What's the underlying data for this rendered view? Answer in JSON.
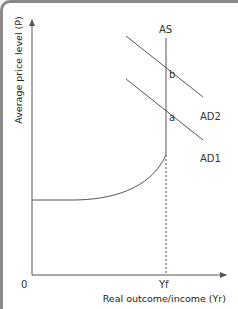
{
  "diagram": {
    "type": "AS-AD model",
    "y_axis_label": "Average price level (P)",
    "x_axis_label": "Real outcome/income (Yr)",
    "origin_label": "0",
    "x_tick_label": "Yf",
    "curves": {
      "as": "AS",
      "ad1": "AD1",
      "ad2": "AD2"
    },
    "points": {
      "a": "a",
      "b": "b"
    },
    "colors": {
      "line": "#555555",
      "text": "#333333",
      "background": "#ffffff"
    }
  }
}
